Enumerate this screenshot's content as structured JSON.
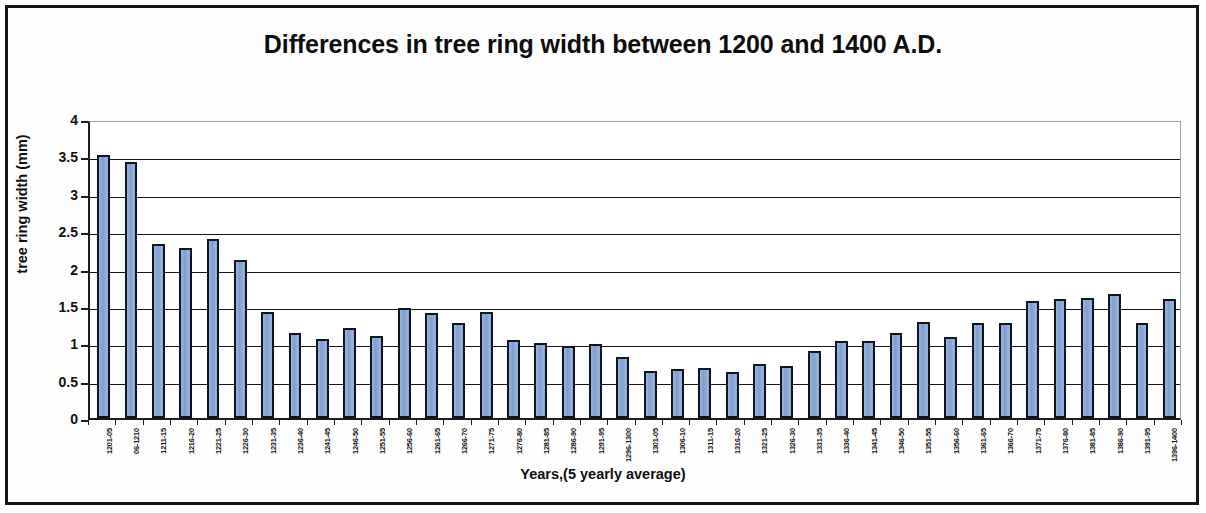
{
  "chart_data": {
    "type": "bar",
    "title": "Differences in tree ring width between 1200 and 1400 A.D.",
    "xlabel": "Years,(5 yearly average)",
    "ylabel": "tree ring width (mm)",
    "ylim": [
      0,
      4
    ],
    "ytick_labels": [
      "4",
      "3.5",
      "3",
      "2.5",
      "2",
      "1.5",
      "1",
      "0.5",
      "0"
    ],
    "ytick_values": [
      4,
      3.5,
      3,
      2.5,
      2,
      1.5,
      1,
      0.5,
      0
    ],
    "grid": true,
    "legend": "none",
    "bar_color": "#8aa8d7",
    "bar_edge_color": "#0e1420",
    "categories": [
      "1201-05",
      "06-1210",
      "1211-15",
      "1216-20",
      "1221-25",
      "1226-30",
      "1231-35",
      "1236-40",
      "1241-45",
      "1246-50",
      "1251-55",
      "1256-60",
      "1261-65",
      "1266-70",
      "1271-75",
      "1276-80",
      "1281-85",
      "1286-90",
      "1291-95",
      "1296-1300",
      "1301-05",
      "1306-10",
      "1311-15",
      "1316-20",
      "1321-25",
      "1326-30",
      "1331-35",
      "1336-40",
      "1341-45",
      "1346-50",
      "1351-55",
      "1356-60",
      "1361-65",
      "1366-70",
      "1371-75",
      "1376-80",
      "1381-85",
      "1386-90",
      "1391-95",
      "1396-1400"
    ],
    "values": [
      3.52,
      3.42,
      2.33,
      2.28,
      2.4,
      2.12,
      1.42,
      1.14,
      1.06,
      1.21,
      1.1,
      1.47,
      1.41,
      1.27,
      1.42,
      1.05,
      1.01,
      0.96,
      0.99,
      0.81,
      0.63,
      0.65,
      0.67,
      0.62,
      0.72,
      0.69,
      0.9,
      1.03,
      1.03,
      1.14,
      1.28,
      1.08,
      1.27,
      1.27,
      1.57,
      1.59,
      1.6,
      1.66,
      1.27,
      1.59
    ]
  }
}
